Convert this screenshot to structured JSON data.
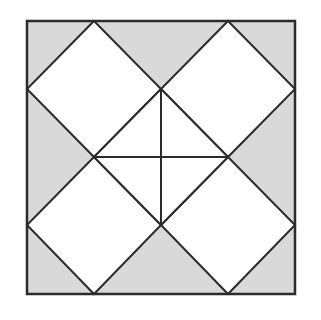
{
  "diagram": {
    "title": "",
    "type": "geometric-quilt-pattern",
    "colors": {
      "background": "#ffffff",
      "shade": "#d9d9d9",
      "stroke": "#2b2b2b",
      "white_region": "#ffffff"
    },
    "outer_square": {
      "x1": 27,
      "y1": 21,
      "x2": 295,
      "y2": 294
    },
    "grid": {
      "x": [
        27,
        94,
        161,
        228,
        295
      ],
      "y": [
        21,
        89,
        157,
        225,
        294
      ]
    },
    "diamonds": [
      {
        "name": "top-left-diamond",
        "points": [
          [
            94,
            21
          ],
          [
            161,
            89
          ],
          [
            94,
            157
          ],
          [
            27,
            89
          ]
        ]
      },
      {
        "name": "top-right-diamond",
        "points": [
          [
            228,
            21
          ],
          [
            295,
            89
          ],
          [
            228,
            157
          ],
          [
            161,
            89
          ]
        ]
      },
      {
        "name": "bottom-left-diamond",
        "points": [
          [
            94,
            157
          ],
          [
            161,
            225
          ],
          [
            94,
            294
          ],
          [
            27,
            225
          ]
        ]
      },
      {
        "name": "bottom-right-diamond",
        "points": [
          [
            228,
            157
          ],
          [
            295,
            225
          ],
          [
            228,
            294
          ],
          [
            161,
            225
          ]
        ]
      }
    ],
    "center_diamond": {
      "points": [
        [
          161,
          89
        ],
        [
          228,
          157
        ],
        [
          161,
          225
        ],
        [
          94,
          157
        ]
      ]
    },
    "center_cross": {
      "horizontal": [
        [
          94,
          157
        ],
        [
          228,
          157
        ]
      ],
      "vertical": [
        [
          161,
          89
        ],
        [
          161,
          225
        ]
      ]
    }
  }
}
